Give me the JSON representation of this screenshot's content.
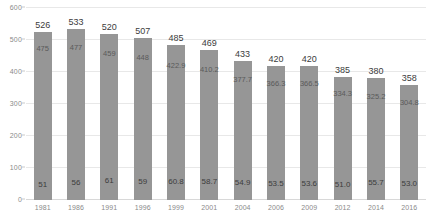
{
  "chart_data": {
    "type": "bar",
    "title": "",
    "xlabel": "",
    "ylabel": "",
    "ylim": [
      0,
      600
    ],
    "ytick_labels": [
      "600",
      "500",
      "400",
      "300",
      "200",
      "100",
      "0"
    ],
    "ytick_values": [
      600,
      500,
      400,
      300,
      200,
      100,
      0
    ],
    "grid": true,
    "legend": "none",
    "bar_color": "#969696",
    "categories": [
      "1981",
      "1986",
      "1991",
      "1996",
      "1999",
      "2001",
      "2004",
      "2006",
      "2009",
      "2012",
      "2014",
      "2016"
    ],
    "values": [
      526,
      533,
      520,
      507,
      485,
      469,
      433,
      420,
      420,
      385,
      380,
      358
    ],
    "series": [
      {
        "name": "total",
        "values": [
          526,
          533,
          520,
          507,
          485,
          469,
          433,
          420,
          420,
          385,
          380,
          358
        ],
        "labels": [
          "526",
          "533",
          "520",
          "507",
          "485",
          "469",
          "433",
          "420",
          "420",
          "385",
          "380",
          "358"
        ]
      },
      {
        "name": "upper-inner",
        "values": [
          475,
          477,
          459,
          448,
          422.9,
          410.2,
          377.7,
          366.3,
          366.5,
          334.3,
          325.2,
          304.8
        ],
        "labels": [
          "475",
          "477",
          "459",
          "448",
          "422.9",
          "410.2",
          "377.7",
          "366.3",
          "366.5",
          "334.3",
          "325.2",
          "304.8"
        ]
      },
      {
        "name": "lower-inner",
        "values": [
          51,
          56,
          61,
          59,
          60.8,
          58.7,
          54.9,
          53.5,
          53.6,
          51.0,
          55.7,
          53.0
        ],
        "labels": [
          "51",
          "56",
          "61",
          "59",
          "60.8",
          "58.7",
          "54.9",
          "53.5",
          "53.6",
          "51.0",
          "55.7",
          "53.0"
        ]
      }
    ]
  }
}
